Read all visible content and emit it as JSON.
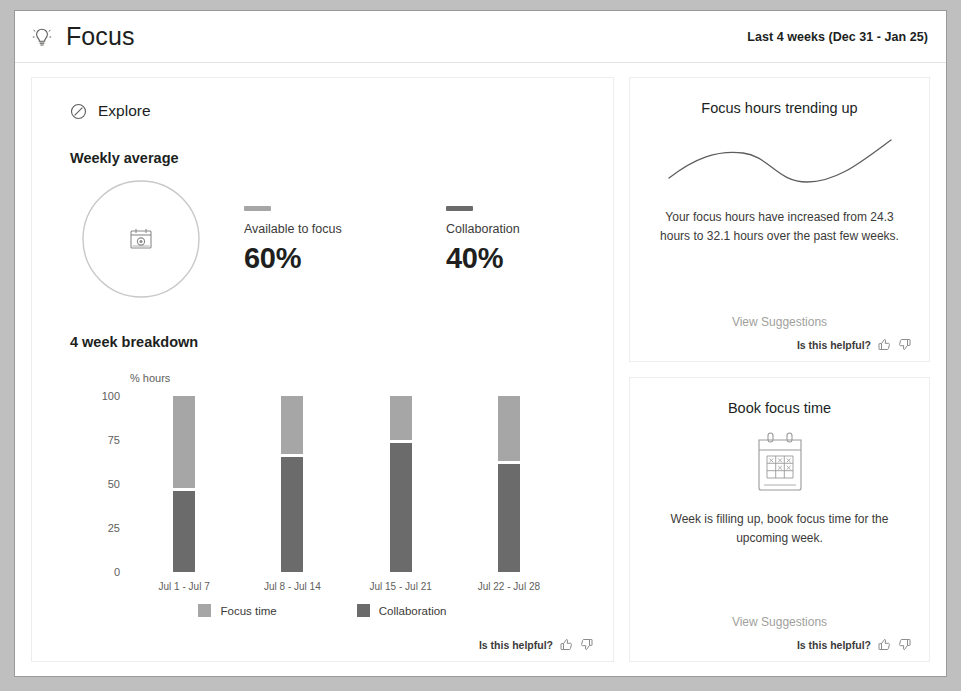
{
  "header": {
    "icon": "lightbulb-icon",
    "title": "Focus",
    "date_range": "Last 4 weeks (Dec 31 - Jan 25)"
  },
  "main": {
    "explore": {
      "icon": "compass-icon",
      "label": "Explore"
    },
    "weekly_average": {
      "heading": "Weekly average",
      "donut_icon": "calendar-clock-icon",
      "metrics": [
        {
          "label": "Available to focus",
          "value": "60%",
          "color": "#a6a6a6"
        },
        {
          "label": "Collaboration",
          "value": "40%",
          "color": "#6b6b6b"
        }
      ]
    },
    "breakdown": {
      "heading": "4 week breakdown",
      "helpful": {
        "label": "Is this helpful?",
        "up_icon": "thumbs-up-icon",
        "down_icon": "thumbs-down-icon"
      }
    }
  },
  "chart_data": {
    "type": "bar",
    "title": "4 week breakdown",
    "stacked": true,
    "categories": [
      "Jul 1 - Jul 7",
      "Jul 8 - Jul 14",
      "Jul 15 - Jul 21",
      "Jul 22 - Jul 28"
    ],
    "series": [
      {
        "name": "Focus time",
        "color": "#a6a6a6",
        "values": [
          52,
          33,
          25,
          37
        ]
      },
      {
        "name": "Collaboration",
        "color": "#6b6b6b",
        "values": [
          48,
          67,
          75,
          63
        ]
      }
    ],
    "xlabel": "",
    "ylabel": "% hours",
    "ylim": [
      0,
      100
    ],
    "yticks": [
      100,
      75,
      50,
      25,
      0
    ],
    "grid": false,
    "legend": "bottom-center"
  },
  "insights": [
    {
      "title": "Focus hours trending up",
      "art": "trend-curve-icon",
      "text": "Your focus hours have increased from 24.3 hours to 32.1 hours over the past few weeks.",
      "link": "View Suggestions",
      "helpful": {
        "label": "Is this helpful?",
        "up_icon": "thumbs-up-icon",
        "down_icon": "thumbs-down-icon"
      }
    },
    {
      "title": "Book focus time",
      "art": "calendar-grid-icon",
      "text": "Week is filling up, book focus time for the upcoming week.",
      "link": "View Suggestions",
      "helpful": {
        "label": "Is this helpful?",
        "up_icon": "thumbs-up-icon",
        "down_icon": "thumbs-down-icon"
      }
    }
  ]
}
